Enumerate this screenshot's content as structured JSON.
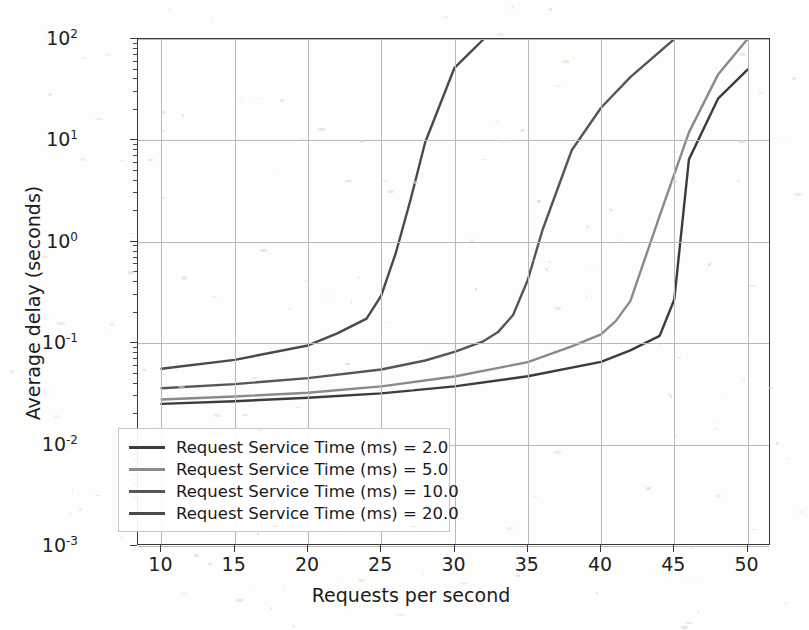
{
  "chart_data": {
    "type": "line",
    "title": "",
    "xlabel": "Requests per second",
    "ylabel": "Average delay (seconds)",
    "xlim": [
      8.4,
      51.6
    ],
    "ylim": [
      0.001,
      100
    ],
    "yscale": "log",
    "xscale": "linear",
    "grid": true,
    "legend_position": "lower left",
    "xticks": [
      10,
      15,
      20,
      25,
      30,
      35,
      40,
      45,
      50
    ],
    "xtick_labels": [
      "10",
      "15",
      "20",
      "25",
      "30",
      "35",
      "40",
      "45",
      "50"
    ],
    "yticks": [
      100,
      10,
      1,
      0.1,
      0.01,
      0.001
    ],
    "ytick_labels": [
      "10",
      "10",
      "10",
      "10",
      "10",
      "10"
    ],
    "ytick_exponents": [
      "2",
      "1",
      "0",
      "-1",
      "-2",
      "-3"
    ],
    "series": [
      {
        "name": "Request Service Time (ms) = 2.0",
        "color": "#3c3c3c",
        "x": [
          10,
          15,
          20,
          25,
          30,
          35,
          40,
          42,
          44,
          45,
          46,
          48,
          50
        ],
        "y": [
          0.0252,
          0.0268,
          0.029,
          0.032,
          0.0375,
          0.0472,
          0.0655,
          0.085,
          0.118,
          0.27,
          6.5,
          26,
          50
        ]
      },
      {
        "name": "Request Service Time (ms) = 5.0",
        "color": "#8a8a8a",
        "x": [
          10,
          15,
          20,
          25,
          30,
          35,
          38,
          40,
          41,
          42,
          44,
          46,
          48,
          50
        ],
        "y": [
          0.0278,
          0.0298,
          0.0325,
          0.0375,
          0.047,
          0.065,
          0.093,
          0.122,
          0.165,
          0.26,
          1.8,
          12,
          45,
          100
        ]
      },
      {
        "name": "Request Service Time (ms) = 10.0",
        "color": "#565656",
        "x": [
          10,
          15,
          20,
          25,
          28,
          30,
          32,
          33,
          34,
          35,
          36,
          38,
          40,
          42,
          45
        ],
        "y": [
          0.036,
          0.0395,
          0.0452,
          0.055,
          0.0675,
          0.082,
          0.105,
          0.13,
          0.19,
          0.42,
          1.3,
          8.0,
          21,
          42,
          100
        ]
      },
      {
        "name": "Request Service Time (ms) = 20.0",
        "color": "#4a4a4a",
        "x": [
          10,
          15,
          20,
          22,
          24,
          25,
          26,
          27,
          28,
          30,
          32
        ],
        "y": [
          0.056,
          0.0685,
          0.095,
          0.125,
          0.175,
          0.295,
          0.78,
          2.6,
          9.6,
          52,
          100
        ]
      }
    ]
  },
  "axes": {
    "xlabel": "Requests per second",
    "ylabel": "Average delay (seconds)"
  },
  "legend": {
    "items": [
      {
        "label": "Request Service Time (ms) = 2.0",
        "color": "#3c3c3c"
      },
      {
        "label": "Request Service Time (ms) = 5.0",
        "color": "#8a8a8a"
      },
      {
        "label": "Request Service Time (ms) = 10.0",
        "color": "#565656"
      },
      {
        "label": "Request Service Time (ms) = 20.0",
        "color": "#4a4a4a"
      }
    ]
  }
}
